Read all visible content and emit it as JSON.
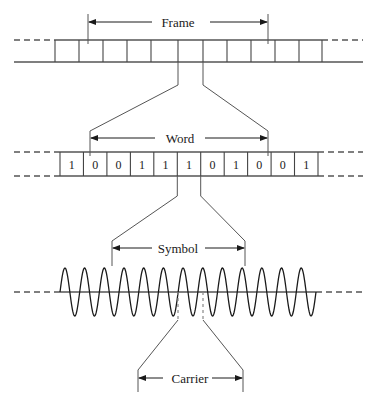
{
  "diagram": {
    "labels": {
      "frame": "Frame",
      "word": "Word",
      "symbol": "Symbol",
      "carrier": "Carrier"
    },
    "frame_row": {
      "label": "Frame",
      "left_dash_x": 14,
      "right_dash_x": 363,
      "top_y": 40,
      "bottom_y": 62,
      "cells_start_x": 55,
      "cells_end_x": 322,
      "cell_count": 11,
      "boundaries": [
        55,
        79,
        103,
        127,
        151,
        178,
        203,
        227,
        251,
        275,
        299,
        322
      ]
    },
    "word_row": {
      "label": "Word",
      "bits": [
        "1",
        "0",
        "0",
        "1",
        "1",
        "1",
        "0",
        "1",
        "0",
        "0",
        "1"
      ],
      "bit_count": 11,
      "top_y": 152,
      "bottom_y": 176,
      "cells_start_x": 60,
      "cells_end_x": 318,
      "left_dash_x": 14,
      "right_dash_x": 363
    },
    "symbol_section": {
      "label": "Symbol",
      "arrow_left_x": 112,
      "arrow_right_x": 245,
      "arrow_y": 248
    },
    "carrier_section": {
      "label": "Carrier",
      "arrow_left_x": 138,
      "arrow_right_x": 243,
      "arrow_y": 378
    },
    "frame_arrow": {
      "left_x": 88,
      "right_x": 268,
      "y": 22
    },
    "word_arrow": {
      "left_x": 90,
      "right_x": 268,
      "y": 138
    },
    "waveform": {
      "type": "sine",
      "baseline_y": 292,
      "amplitude": 24,
      "start_x": 60,
      "end_x": 316,
      "cycles": 13,
      "left_dash_x": 14,
      "right_dash_x": 363,
      "marker_left_x": 178,
      "marker_right_x": 203
    },
    "selected_cell": {
      "left_x": 178,
      "right_x": 203
    }
  }
}
